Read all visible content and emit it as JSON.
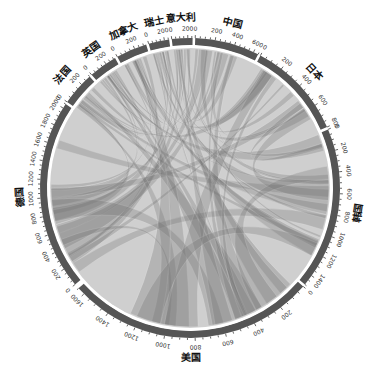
{
  "chart_data": {
    "type": "chord",
    "title": "",
    "center": [
      190,
      188
    ],
    "radius_inner": 143,
    "radius_outer": 150,
    "segments": [
      {
        "name": "德国",
        "total": 2050,
        "start_deg": -130,
        "end_deg": -56,
        "ticks": [
          0,
          200,
          400,
          600,
          800,
          1000,
          1200,
          1400,
          1600,
          1800,
          2000
        ]
      },
      {
        "name": "法国",
        "total": 300,
        "start_deg": -55,
        "end_deg": -42,
        "ticks": [
          0,
          200
        ]
      },
      {
        "name": "英国",
        "total": 320,
        "start_deg": -41,
        "end_deg": -30,
        "ticks": [
          0,
          200
        ]
      },
      {
        "name": "加拿大",
        "total": 330,
        "start_deg": -29,
        "end_deg": -17,
        "ticks": [
          0,
          200
        ]
      },
      {
        "name": "瑞士",
        "total": 260,
        "start_deg": -16,
        "end_deg": -8,
        "ticks": [
          0,
          200
        ]
      },
      {
        "name": "意大利",
        "total": 260,
        "start_deg": -7,
        "end_deg": 1,
        "ticks": [
          0,
          200
        ]
      },
      {
        "name": "中国",
        "total": 650,
        "start_deg": 2,
        "end_deg": 27,
        "ticks": [
          0,
          200,
          400,
          600
        ]
      },
      {
        "name": "日本",
        "total": 800,
        "start_deg": 28,
        "end_deg": 66,
        "ticks": [
          0,
          200,
          400,
          600,
          800
        ]
      },
      {
        "name": "韩国",
        "total": 1500,
        "start_deg": 67,
        "end_deg": 130,
        "ticks": [
          0,
          200,
          400,
          600,
          800,
          1000,
          1200,
          1400
        ]
      },
      {
        "name": "美国",
        "total": 1650,
        "start_deg": 131,
        "end_deg": 228,
        "ticks": [
          0,
          200,
          400,
          600,
          800,
          1000,
          1200,
          1400,
          1600
        ]
      }
    ],
    "ribbon_color": "#707070",
    "ring_color": "#555555",
    "caption": "图 …"
  },
  "caption": ""
}
